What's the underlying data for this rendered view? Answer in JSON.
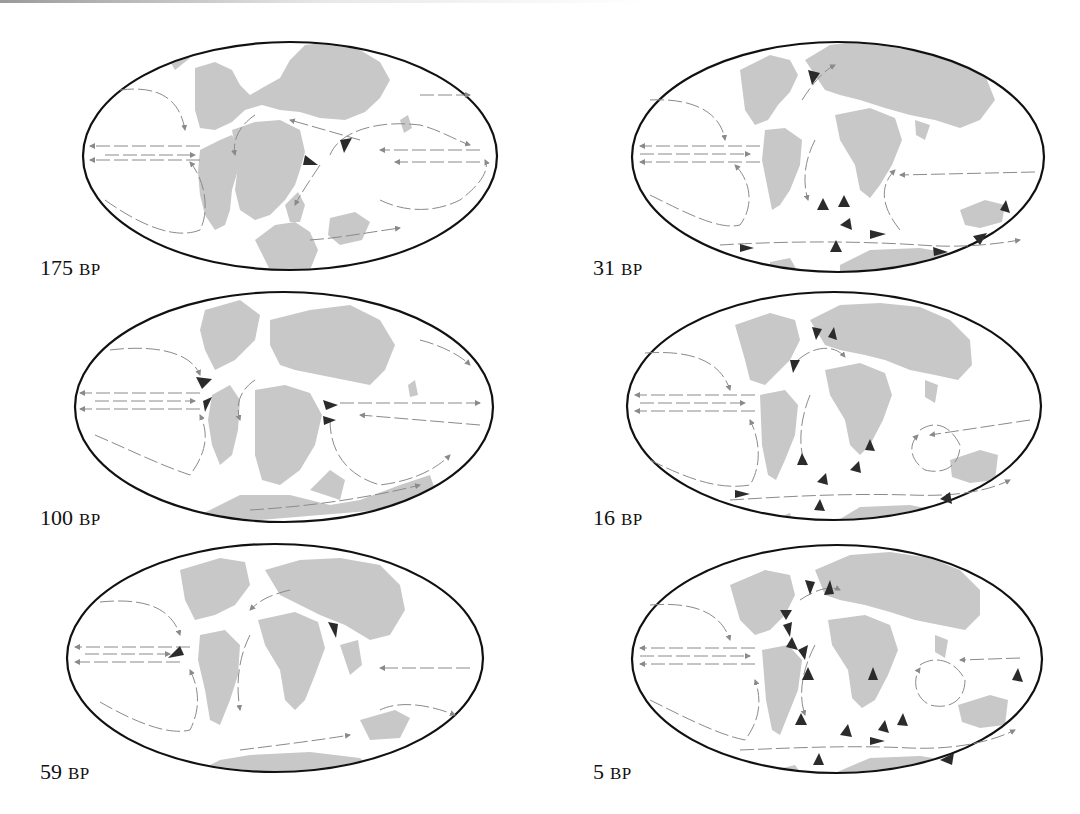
{
  "figure": {
    "colors": {
      "land": "#c8c8c8",
      "ocean": "#ffffff",
      "outline": "#111111",
      "current_arrow": "#8a8a8a",
      "major_arrow": "#2b2b2b"
    },
    "panels": [
      {
        "id": "175",
        "age": "175",
        "unit": "BP"
      },
      {
        "id": "31",
        "age": "31",
        "unit": "BP"
      },
      {
        "id": "100",
        "age": "100",
        "unit": "BP"
      },
      {
        "id": "16",
        "age": "16",
        "unit": "BP"
      },
      {
        "id": "59",
        "age": "59",
        "unit": "BP"
      },
      {
        "id": "5",
        "age": "5",
        "unit": "BP"
      }
    ]
  }
}
